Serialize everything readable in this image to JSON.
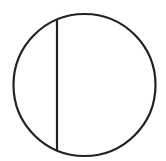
{
  "diagram": {
    "type": "circle-with-chord",
    "canvas": {
      "width": 166,
      "height": 161
    },
    "background": "#ffffff",
    "stroke_color": "#222222",
    "stroke_width": 2.2,
    "circle": {
      "cx": 84.5,
      "cy": 85,
      "r": 71
    },
    "chord": {
      "x1": 57,
      "y1": 19,
      "x2": 57,
      "y2": 151
    }
  }
}
